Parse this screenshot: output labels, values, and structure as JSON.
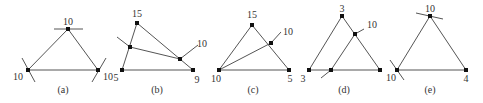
{
  "figure": {
    "panels": [
      {
        "caption": "(a)",
        "nodes": [
          {
            "id": "top",
            "x": 68,
            "y": 29,
            "label": "10",
            "lx": 68,
            "ly": 25
          },
          {
            "id": "bl",
            "x": 28,
            "y": 70,
            "label": "10",
            "lx": 18,
            "ly": 80
          },
          {
            "id": "br",
            "x": 98,
            "y": 70,
            "label": "10",
            "lx": 108,
            "ly": 80
          }
        ],
        "edges": [
          [
            "top",
            "bl"
          ],
          [
            "top",
            "br"
          ],
          [
            "bl",
            "br"
          ]
        ],
        "ticks": [
          [
            54,
            29,
            83,
            29
          ],
          [
            22,
            58,
            35,
            82
          ],
          [
            106,
            58,
            92,
            82
          ]
        ]
      },
      {
        "caption": "(b)",
        "nodes": [
          {
            "id": "top",
            "x": 137,
            "y": 23,
            "label": "15",
            "lx": 137,
            "ly": 17
          },
          {
            "id": "bl",
            "x": 122,
            "y": 70,
            "label": "5",
            "lx": 116,
            "ly": 81
          },
          {
            "id": "br",
            "x": 193,
            "y": 70,
            "label": "9",
            "lx": 197,
            "ly": 83
          },
          {
            "id": "m1",
            "x": 130,
            "y": 47,
            "label": "",
            "lx": 0,
            "ly": 0
          },
          {
            "id": "m2",
            "x": 180,
            "y": 59,
            "label": "10",
            "lx": 202,
            "ly": 47
          }
        ],
        "edges": [
          [
            "top",
            "bl"
          ],
          [
            "top",
            "br"
          ],
          [
            "bl",
            "br"
          ],
          [
            "m1",
            "m2"
          ]
        ],
        "ticks": [
          [
            117,
            37,
            130,
            47
          ],
          [
            180,
            59,
            198,
            45
          ]
        ]
      },
      {
        "caption": "(c)",
        "nodes": [
          {
            "id": "top",
            "x": 252,
            "y": 25,
            "label": "15",
            "lx": 252,
            "ly": 18
          },
          {
            "id": "bl",
            "x": 219,
            "y": 70,
            "label": "10",
            "lx": 216,
            "ly": 82
          },
          {
            "id": "br",
            "x": 289,
            "y": 70,
            "label": "5",
            "lx": 290,
            "ly": 82
          },
          {
            "id": "m1",
            "x": 271,
            "y": 43,
            "label": "10",
            "lx": 288,
            "ly": 35
          }
        ],
        "edges": [
          [
            "top",
            "bl"
          ],
          [
            "top",
            "br"
          ],
          [
            "bl",
            "br"
          ],
          [
            "bl",
            "m1"
          ]
        ],
        "ticks": [
          [
            271,
            43,
            281,
            32
          ]
        ]
      },
      {
        "caption": "(d)",
        "nodes": [
          {
            "id": "top",
            "x": 342,
            "y": 16,
            "label": "3",
            "lx": 342,
            "ly": 12
          },
          {
            "id": "bl",
            "x": 309,
            "y": 70,
            "label": "3",
            "lx": 303,
            "ly": 82
          },
          {
            "id": "br",
            "x": 380,
            "y": 70,
            "label": "",
            "lx": 0,
            "ly": 0
          },
          {
            "id": "m1",
            "x": 355,
            "y": 34,
            "label": "10",
            "lx": 372,
            "ly": 28
          },
          {
            "id": "m2",
            "x": 331,
            "y": 70,
            "label": "",
            "lx": 0,
            "ly": 0
          }
        ],
        "edges": [
          [
            "top",
            "bl"
          ],
          [
            "top",
            "br"
          ],
          [
            "bl",
            "br"
          ],
          [
            "m2",
            "m1"
          ]
        ],
        "ticks": [
          [
            321,
            78,
            331,
            70
          ],
          [
            355,
            34,
            364,
            29
          ]
        ]
      },
      {
        "caption": "(e)",
        "nodes": [
          {
            "id": "top",
            "x": 430,
            "y": 16,
            "label": "10",
            "lx": 430,
            "ly": 12
          },
          {
            "id": "bl",
            "x": 397,
            "y": 70,
            "label": "10",
            "lx": 391,
            "ly": 81
          },
          {
            "id": "br",
            "x": 466,
            "y": 70,
            "label": "4",
            "lx": 466,
            "ly": 82
          }
        ],
        "edges": [
          [
            "top",
            "bl"
          ],
          [
            "top",
            "br"
          ],
          [
            "bl",
            "br"
          ]
        ],
        "ticks": [
          [
            416,
            13,
            443,
            19
          ],
          [
            390,
            60,
            404,
            80
          ]
        ]
      }
    ],
    "caption_positions": [
      63,
      157,
      253,
      344,
      430
    ],
    "caption_y": 93
  }
}
